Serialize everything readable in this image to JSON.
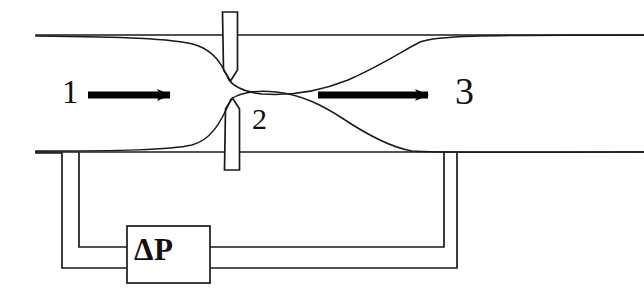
{
  "figure": {
    "kind": "orifice-plate-flow-meter-schematic",
    "background_color": "#ffffff",
    "line_color": "#1a1a1a",
    "arrow_color": "#000000"
  },
  "labels": {
    "station_upstream": "1",
    "station_throat": "2",
    "station_downstream": "3",
    "transmitter": "ΔP"
  },
  "icons": {
    "upstream_flow_arrow": "right-arrow-icon",
    "downstream_flow_arrow": "right-arrow-icon"
  },
  "geometry": {
    "pipe_top_y": 35,
    "pipe_bottom_y": 152,
    "plate_top": {
      "x": 222,
      "y_top": 12,
      "y_tip": 80,
      "width": 15
    },
    "plate_bottom": {
      "x": 224,
      "y_bottom": 170,
      "y_tip": 99,
      "width": 15
    },
    "tap_left_inner_x": 79,
    "tap_left_outer_x": 62,
    "tap_right_inner_x": 444,
    "tap_right_outer_x": 457,
    "manifold_upper_y": 247,
    "manifold_lower_y": 268,
    "dp_box": {
      "x": 127,
      "y": 226,
      "width": 83,
      "height": 57
    }
  }
}
